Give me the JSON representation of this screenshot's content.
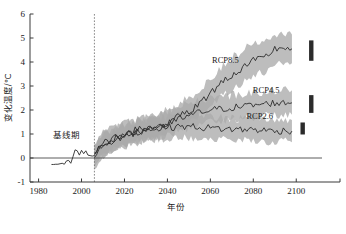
{
  "chart_data": {
    "type": "line",
    "title": "",
    "xlabel": "年份",
    "ylabel": "变化温度/℃",
    "xlim": [
      1976,
      2112
    ],
    "ylim": [
      -1,
      6
    ],
    "xticks": [
      1980,
      2000,
      2020,
      2040,
      2060,
      2080,
      2100
    ],
    "xticklabels": [
      "1980",
      "2000",
      "2020",
      "2040",
      "2060",
      "2080",
      "2100"
    ],
    "yticks": [
      -1,
      0,
      1,
      2,
      3,
      4,
      5,
      6
    ],
    "yticklabels": [
      "-1",
      "0",
      "1",
      "2",
      "3",
      "4",
      "5",
      "6"
    ],
    "grid": false,
    "legend_position": "inline-right",
    "annotations": [
      {
        "text": "基线期",
        "x": 1993,
        "y": 0.85
      },
      {
        "text": "RCP8.5",
        "x": 2067,
        "y": 3.95
      },
      {
        "text": "RCP4.5",
        "x": 2086,
        "y": 2.72
      },
      {
        "text": "RCP2.6",
        "x": 2083,
        "y": 1.62
      }
    ],
    "reference_lines": [
      {
        "orientation": "vertical",
        "value": 2006,
        "style": "dotted",
        "label": "历史/预估分界"
      },
      {
        "orientation": "horizontal",
        "value": 0,
        "style": "solid",
        "label": "零变化基准线"
      }
    ],
    "series": [
      {
        "name": "历史",
        "color": "#2b2b2b",
        "x": [
          1986,
          1987,
          1988,
          1989,
          1990,
          1991,
          1992,
          1993,
          1994,
          1995,
          1996,
          1997,
          1998,
          1999,
          2000,
          2001,
          2002,
          2003,
          2004,
          2005,
          2006
        ],
        "values": [
          -0.27,
          -0.27,
          -0.26,
          -0.26,
          -0.24,
          -0.22,
          -0.26,
          -0.12,
          -0.1,
          -0.22,
          0.05,
          0.34,
          0.3,
          0.12,
          0.32,
          0.18,
          0.3,
          0.12,
          0.1,
          0.08,
          0.1
        ]
      },
      {
        "name": "RCP8.5",
        "color": "#2b2b2b",
        "x": [
          2006,
          2010,
          2015,
          2020,
          2025,
          2030,
          2035,
          2040,
          2045,
          2050,
          2055,
          2060,
          2065,
          2070,
          2075,
          2080,
          2085,
          2090,
          2095,
          2098
        ],
        "values": [
          0.15,
          0.55,
          0.7,
          0.95,
          1.05,
          1.2,
          1.35,
          1.45,
          1.7,
          1.95,
          2.25,
          2.7,
          3.15,
          3.45,
          3.75,
          4.05,
          4.15,
          4.55,
          4.6,
          4.55
        ],
        "band_lower": [
          -0.25,
          0.1,
          0.25,
          0.5,
          0.6,
          0.75,
          0.85,
          0.95,
          1.2,
          1.45,
          1.75,
          2.15,
          2.55,
          2.85,
          3.15,
          3.45,
          3.55,
          3.95,
          4.0,
          3.95
        ],
        "band_upper": [
          0.55,
          1.0,
          1.2,
          1.45,
          1.55,
          1.7,
          1.9,
          2.0,
          2.25,
          2.5,
          2.8,
          3.3,
          3.8,
          4.15,
          4.5,
          4.8,
          4.95,
          5.2,
          5.25,
          5.15
        ]
      },
      {
        "name": "RCP4.5",
        "color": "#2b2b2b",
        "x": [
          2006,
          2010,
          2015,
          2020,
          2025,
          2030,
          2035,
          2040,
          2045,
          2050,
          2055,
          2060,
          2065,
          2070,
          2075,
          2080,
          2085,
          2090,
          2095,
          2098
        ],
        "values": [
          0.12,
          0.6,
          0.8,
          1.0,
          1.15,
          1.25,
          1.3,
          1.4,
          1.6,
          1.75,
          1.9,
          2.0,
          2.05,
          2.1,
          2.15,
          2.2,
          2.25,
          2.3,
          2.28,
          2.3
        ],
        "band_lower": [
          -0.3,
          0.15,
          0.35,
          0.55,
          0.7,
          0.8,
          0.85,
          0.95,
          1.1,
          1.25,
          1.4,
          1.5,
          1.55,
          1.6,
          1.65,
          1.7,
          1.75,
          1.8,
          1.78,
          1.8
        ],
        "band_upper": [
          0.55,
          1.05,
          1.25,
          1.45,
          1.6,
          1.7,
          1.8,
          1.9,
          2.1,
          2.25,
          2.4,
          2.5,
          2.55,
          2.62,
          2.68,
          2.72,
          2.78,
          2.82,
          2.8,
          2.82
        ]
      },
      {
        "name": "RCP2.6",
        "color": "#2b2b2b",
        "x": [
          2006,
          2010,
          2015,
          2020,
          2025,
          2030,
          2035,
          2040,
          2045,
          2050,
          2055,
          2060,
          2065,
          2070,
          2075,
          2080,
          2085,
          2090,
          2095,
          2098
        ],
        "values": [
          0.1,
          0.58,
          0.78,
          0.95,
          1.08,
          1.18,
          1.25,
          1.28,
          1.3,
          1.32,
          1.28,
          1.25,
          1.22,
          1.2,
          1.18,
          1.2,
          1.15,
          1.12,
          1.15,
          1.12
        ],
        "band_lower": [
          -0.35,
          0.12,
          0.32,
          0.5,
          0.62,
          0.72,
          0.78,
          0.82,
          0.85,
          0.86,
          0.82,
          0.8,
          0.76,
          0.74,
          0.72,
          0.74,
          0.7,
          0.66,
          0.7,
          0.66
        ],
        "band_upper": [
          0.52,
          1.02,
          1.22,
          1.4,
          1.52,
          1.62,
          1.7,
          1.74,
          1.76,
          1.78,
          1.74,
          1.7,
          1.68,
          1.66,
          1.64,
          1.66,
          1.6,
          1.58,
          1.6,
          1.58
        ]
      }
    ],
    "range_bars": [
      {
        "name": "RCP8.5",
        "x": 2107,
        "low": 4.05,
        "high": 4.9,
        "color": "#2b2b2b"
      },
      {
        "name": "RCP4.5",
        "x": 2107,
        "low": 1.88,
        "high": 2.62,
        "color": "#2b2b2b"
      },
      {
        "name": "RCP2.6",
        "x": 2103,
        "low": 0.98,
        "high": 1.48,
        "color": "#2b2b2b"
      }
    ]
  }
}
